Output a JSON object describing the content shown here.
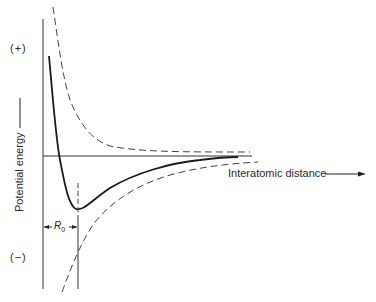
{
  "diagram": {
    "y_axis_label": "Potential energy",
    "x_axis_label": "Interatomic distance",
    "positive_marker": "(+)",
    "negative_marker": "(−)",
    "equilibrium_label": "R",
    "equilibrium_subscript": "0",
    "curves": [
      {
        "name": "net potential energy",
        "style": "solid"
      },
      {
        "name": "repulsive energy",
        "style": "dashed"
      },
      {
        "name": "attractive energy",
        "style": "dashed"
      }
    ],
    "colors": {
      "line": "#1a1a1a",
      "dashed": "#444444"
    }
  }
}
